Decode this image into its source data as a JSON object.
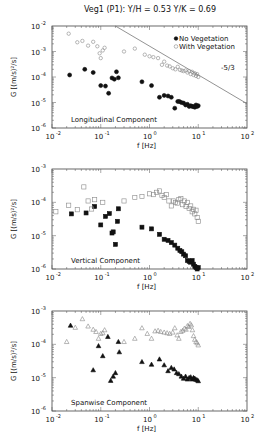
{
  "figure_title": "Veg1 (P1):  Y/H = 0.53 Y/K = 0.69",
  "chart_data": [
    {
      "type": "scatter",
      "title": "Longitudinal Component",
      "xlabel": "f [Hz]",
      "ylabel": "G [(m/s)²/s]",
      "xscale": "log",
      "yscale": "log",
      "xlim": [
        0.01,
        100
      ],
      "ylim": [
        1e-06,
        0.01
      ],
      "x_tick_labels": [
        {
          "base": "10",
          "exp": "-2"
        },
        {
          "base": "10",
          "exp": "-1"
        },
        {
          "base": "10",
          "exp": "0"
        },
        {
          "base": "10",
          "exp": "1"
        },
        {
          "base": "10",
          "exp": "2"
        }
      ],
      "y_tick_labels": [
        {
          "base": "10",
          "exp": "-6"
        },
        {
          "base": "10",
          "exp": "-5"
        },
        {
          "base": "10",
          "exp": "-4"
        },
        {
          "base": "10",
          "exp": "-3"
        },
        {
          "base": "10",
          "exp": "-2"
        }
      ],
      "legend": {
        "placement": "top-right",
        "entries": [
          "No Vegetation",
          "With Vegetation"
        ]
      },
      "reference_line": {
        "label": "-5/3",
        "slope": -1.6667,
        "x": [
          0.2,
          100
        ],
        "y": [
          0.01,
          9e-06
        ]
      },
      "series": [
        {
          "name": "No Vegetation",
          "marker": "filled-circle",
          "x": [
            0.023,
            0.047,
            0.07,
            0.1,
            0.125,
            0.145,
            0.17,
            0.19,
            0.21,
            0.23,
            0.7,
            1.1,
            1.6,
            2.0,
            2.4,
            2.8,
            3.3,
            3.8,
            4.1,
            4.5,
            5.0,
            5.5,
            6.0,
            6.5,
            7.0,
            7.5,
            8.0,
            8.5,
            9.0,
            9.5,
            10.0
          ],
          "y": [
            0.00012,
            0.0002,
            0.00015,
            4.6e-05,
            4.4e-05,
            2.3e-05,
            9.2e-05,
            8.2e-05,
            0.00016,
            9.3e-05,
            6.5e-05,
            4.6e-05,
            1.6e-05,
            1.9e-05,
            1.8e-05,
            1.6e-05,
            6e-06,
            1.1e-05,
            1.1e-05,
            1e-05,
            9.5e-06,
            8e-06,
            8.5e-06,
            7e-06,
            7.5e-06,
            7e-06,
            7e-06,
            6.5e-06,
            8e-06,
            7e-06,
            7.5e-06
          ]
        },
        {
          "name": "With Vegetation",
          "marker": "open-circle",
          "x": [
            0.022,
            0.033,
            0.042,
            0.055,
            0.07,
            0.085,
            0.095,
            0.1,
            0.11,
            0.12,
            0.3,
            0.5,
            0.8,
            1.0,
            1.2,
            1.5,
            1.8,
            2.0,
            2.3,
            2.6,
            3.0,
            3.4,
            3.8,
            4.2,
            4.6,
            5.0,
            5.5,
            6.0,
            6.5,
            7.0,
            7.5,
            8.0,
            8.5,
            9.0,
            9.5,
            10.0
          ],
          "y": [
            0.005,
            0.0023,
            0.0026,
            0.0017,
            0.0024,
            0.0016,
            0.00085,
            0.00055,
            0.0011,
            0.0014,
            0.001,
            0.0013,
            0.00075,
            0.00065,
            0.0006,
            0.00055,
            0.0003,
            0.0004,
            0.00028,
            0.00026,
            0.00022,
            0.0002,
            0.00025,
            0.00019,
            0.00018,
            0.00017,
            0.00018,
            0.00015,
            0.00017,
            0.00013,
            0.00016,
            0.00012,
            0.00014,
            0.00011,
            0.00013,
            0.0001
          ]
        }
      ]
    },
    {
      "type": "scatter",
      "title": "Vertical Component",
      "xlabel": "f [Hz]",
      "ylabel": "G [(m/s)²/s]",
      "xscale": "log",
      "yscale": "log",
      "xlim": [
        0.01,
        100
      ],
      "ylim": [
        1e-06,
        0.001
      ],
      "x_tick_labels": [
        {
          "base": "10",
          "exp": "-2"
        },
        {
          "base": "10",
          "exp": "-1"
        },
        {
          "base": "10",
          "exp": "0"
        },
        {
          "base": "10",
          "exp": "1"
        },
        {
          "base": "10",
          "exp": "2"
        }
      ],
      "y_tick_labels": [
        {
          "base": "10",
          "exp": "-6"
        },
        {
          "base": "10",
          "exp": "-5"
        },
        {
          "base": "10",
          "exp": "-4"
        },
        {
          "base": "10",
          "exp": "-3"
        }
      ],
      "series": [
        {
          "name": "No Vegetation",
          "marker": "filled-square",
          "x": [
            0.025,
            0.05,
            0.075,
            0.1,
            0.125,
            0.15,
            0.17,
            0.18,
            0.2,
            0.22,
            0.23,
            0.7,
            1.1,
            1.6,
            2.0,
            2.4,
            2.8,
            3.3,
            3.8,
            4.2,
            4.6,
            5.0,
            5.5,
            6.0,
            6.5,
            7.0,
            7.5,
            8.0,
            8.5,
            9.0,
            9.5,
            10.0
          ],
          "y": [
            4.5e-05,
            4.8e-05,
            7.5e-05,
            2.1e-05,
            3.8e-05,
            4.6e-05,
            1.2e-05,
            1.3e-05,
            5.5e-06,
            2.7e-05,
            6.4e-05,
            1.8e-05,
            1.6e-05,
            1.1e-05,
            7.8e-06,
            7.2e-06,
            6.2e-06,
            5.2e-06,
            4.2e-06,
            3.6e-06,
            3.3e-06,
            2.8e-06,
            2.5e-06,
            1.8e-06,
            1.7e-06,
            1.6e-06,
            1.8e-06,
            1.4e-06,
            1.2e-06,
            1.1e-06,
            1e-06,
            1.1e-06
          ]
        },
        {
          "name": "With Vegetation",
          "marker": "open-square",
          "x": [
            0.012,
            0.022,
            0.033,
            0.045,
            0.055,
            0.065,
            0.075,
            0.11,
            0.3,
            0.5,
            0.7,
            1.0,
            1.2,
            1.4,
            1.6,
            1.8,
            2.0,
            2.2,
            2.5,
            2.8,
            3.1,
            3.4,
            3.7,
            4.0,
            4.4,
            4.8,
            5.2,
            5.6,
            6.0,
            6.5,
            7.0,
            7.5,
            8.0,
            8.5,
            9.0,
            9.5,
            10.0
          ],
          "y": [
            5.2e-05,
            8.2e-05,
            6e-05,
            0.00029,
            0.00011,
            6.3e-05,
            0.00012,
            0.0001,
            0.00011,
            0.00014,
            0.00015,
            0.00018,
            0.00017,
            0.0002,
            0.00022,
            0.00016,
            0.00014,
            0.00017,
            0.00011,
            7.8e-05,
            0.00011,
            0.0001,
            9.5e-05,
            0.00012,
            0.00013,
            8.5e-05,
            0.00011,
            7.5e-05,
            0.0001,
            6.5e-05,
            7.8e-05,
            5.2e-05,
            6.2e-05,
            4.5e-05,
            5.8e-05,
            3.5e-05,
            2.7e-05
          ]
        }
      ]
    },
    {
      "type": "scatter",
      "title": "Spanwise Component",
      "xlabel": "f [Hz]",
      "ylabel": "G [(m/s)²/s]",
      "xscale": "log",
      "yscale": "log",
      "xlim": [
        0.01,
        100
      ],
      "ylim": [
        1e-06,
        0.001
      ],
      "x_tick_labels": [
        {
          "base": "10",
          "exp": "-2"
        },
        {
          "base": "10",
          "exp": "-1"
        },
        {
          "base": "10",
          "exp": "0"
        },
        {
          "base": "10",
          "exp": "1"
        },
        {
          "base": "10",
          "exp": "2"
        }
      ],
      "y_tick_labels": [
        {
          "base": "10",
          "exp": "-6"
        },
        {
          "base": "10",
          "exp": "-5"
        },
        {
          "base": "10",
          "exp": "-4"
        },
        {
          "base": "10",
          "exp": "-3"
        }
      ],
      "series": [
        {
          "name": "No Vegetation",
          "marker": "filled-triangle",
          "x": [
            0.024,
            0.07,
            0.09,
            0.11,
            0.14,
            0.16,
            0.18,
            0.2,
            0.23,
            0.24,
            0.7,
            1.1,
            1.6,
            2.0,
            2.4,
            2.8,
            3.2,
            3.6,
            4.0,
            4.5,
            5.0,
            5.5,
            6.0,
            6.5,
            7.0,
            7.5,
            8.0,
            8.5,
            9.0,
            9.5,
            10.0
          ],
          "y": [
            0.00037,
            1.7e-05,
            9e-05,
            4.5e-05,
            0.00017,
            8.2e-06,
            1.1e-05,
            1.4e-05,
            0.00012,
            5.9e-05,
            3e-05,
            2.5e-05,
            3.6e-05,
            2.4e-05,
            1.6e-05,
            2e-05,
            1.8e-05,
            1.4e-05,
            1.3e-05,
            1.1e-05,
            9.5e-06,
            1.1e-05,
            9e-06,
            1e-05,
            1.05e-05,
            9e-06,
            1e-05,
            9.5e-06,
            8.8e-06,
            8.5e-06,
            8e-06
          ]
        },
        {
          "name": "With Vegetation",
          "marker": "open-triangle",
          "x": [
            0.02,
            0.03,
            0.042,
            0.055,
            0.07,
            0.08,
            0.09,
            0.1,
            0.11,
            0.12,
            0.3,
            0.5,
            0.7,
            0.9,
            1.1,
            1.3,
            1.5,
            1.7,
            2.0,
            2.3,
            2.6,
            3.0,
            3.3,
            3.7,
            4.0,
            4.4,
            4.8,
            5.2,
            5.6,
            6.0,
            6.4,
            6.8,
            7.2,
            7.6,
            8.0,
            8.5,
            9.0,
            9.5,
            10.0
          ],
          "y": [
            0.00012,
            0.00032,
            0.00058,
            0.00035,
            0.00028,
            0.00024,
            0.00015,
            0.00021,
            0.00022,
            0.00027,
            0.00012,
            0.00015,
            0.00031,
            0.00021,
            0.00015,
            0.00025,
            0.00026,
            0.00024,
            0.00023,
            0.00022,
            0.00021,
            0.00023,
            0.00031,
            0.00019,
            0.00015,
            0.00024,
            0.00026,
            0.0003,
            0.00028,
            0.00036,
            0.00034,
            0.00042,
            0.00038,
            0.00027,
            0.00018,
            0.00014,
            0.00012,
            0.00011,
            9.5e-05
          ]
        }
      ]
    }
  ]
}
